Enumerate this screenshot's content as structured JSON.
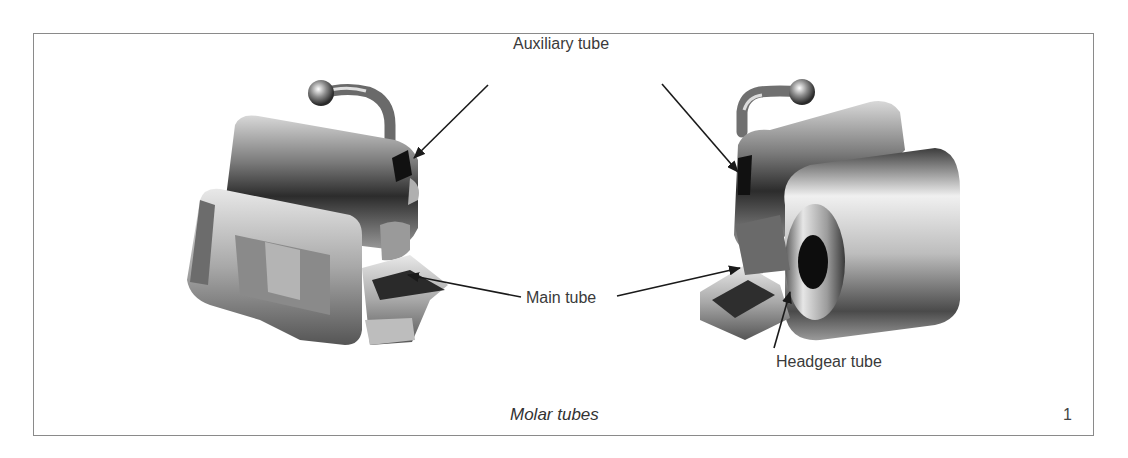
{
  "figure": {
    "caption": "Molar tubes",
    "number": "1",
    "labels": {
      "auxiliary_tube": "Auxiliary tube",
      "main_tube": "Main tube",
      "headgear_tube": "Headgear tube"
    },
    "items": [
      {
        "name": "left-molar-tube",
        "description": "Molar tube with hook (buccal view)"
      },
      {
        "name": "right-molar-tube",
        "description": "Molar tube with hook and headgear tube"
      }
    ],
    "colors": {
      "frame": "#8a8a8a",
      "text": "#3a3a3a",
      "arrow": "#222222"
    }
  }
}
